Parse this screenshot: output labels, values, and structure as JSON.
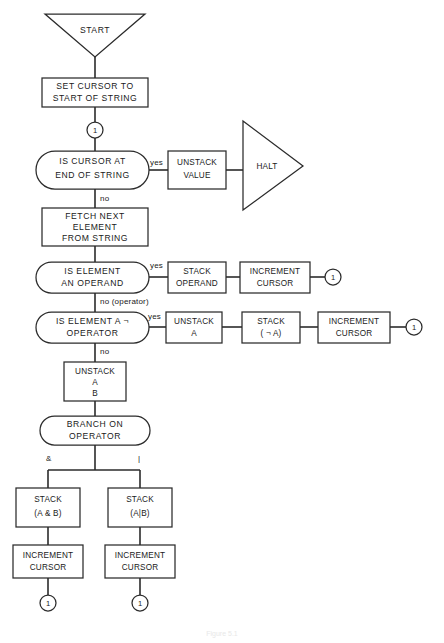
{
  "diagram": {
    "caption": "Figure 5.1",
    "background_color": "#ffffff",
    "line_color": "#2b2b2b",
    "text_color": "#1a1a1a"
  },
  "nodes": {
    "start": {
      "id": "start",
      "shape": "triangle-down",
      "label": "START"
    },
    "set_cursor": {
      "id": "set_cursor",
      "shape": "rect",
      "line1": "SET CURSOR TO",
      "line2": "START OF STRING"
    },
    "conn_top": {
      "id": "conn_top",
      "shape": "circle",
      "label": "1"
    },
    "is_cursor_end": {
      "id": "is_cursor_end",
      "shape": "stadium",
      "line1": "IS CURSOR AT",
      "line2": "END OF STRING"
    },
    "unstack_value": {
      "id": "unstack_value",
      "shape": "rect",
      "line1": "UNSTACK",
      "line2": "VALUE"
    },
    "halt": {
      "id": "halt",
      "shape": "triangle-right",
      "label": "HALT"
    },
    "fetch_next": {
      "id": "fetch_next",
      "shape": "rect",
      "line1": "FETCH NEXT",
      "line2": "ELEMENT",
      "line3": "FROM STRING"
    },
    "is_operand": {
      "id": "is_operand",
      "shape": "stadium",
      "line1": "IS ELEMENT",
      "line2": "AN OPERAND"
    },
    "stack_operand": {
      "id": "stack_operand",
      "shape": "rect",
      "line1": "STACK",
      "line2": "OPERAND"
    },
    "incr_cursor_1": {
      "id": "incr_cursor_1",
      "shape": "rect",
      "line1": "INCREMENT",
      "line2": "CURSOR"
    },
    "conn_r1": {
      "id": "conn_r1",
      "shape": "circle",
      "label": "1"
    },
    "is_not_operator": {
      "id": "is_not_operator",
      "shape": "stadium",
      "line1": "IS ELEMENT A ¬",
      "line2": "OPERATOR"
    },
    "unstack_a": {
      "id": "unstack_a",
      "shape": "rect",
      "line1": "UNSTACK",
      "line2": "A"
    },
    "stack_not_a": {
      "id": "stack_not_a",
      "shape": "rect",
      "line1": "STACK",
      "line2": "( ¬ A)"
    },
    "incr_cursor_2": {
      "id": "incr_cursor_2",
      "shape": "rect",
      "line1": "INCREMENT",
      "line2": "CURSOR"
    },
    "conn_r2": {
      "id": "conn_r2",
      "shape": "circle",
      "label": "1"
    },
    "unstack_ab": {
      "id": "unstack_ab",
      "shape": "rect",
      "line1": "UNSTACK",
      "line2": "A",
      "line3": "B"
    },
    "branch_on_operator": {
      "id": "branch_on_operator",
      "shape": "stadium",
      "line1": "BRANCH ON",
      "line2": "OPERATOR"
    },
    "stack_and": {
      "id": "stack_and",
      "shape": "rect",
      "line1": "STACK",
      "line2": "(A & B)"
    },
    "stack_or": {
      "id": "stack_or",
      "shape": "rect",
      "line1": "STACK",
      "line2": "(A|B)"
    },
    "incr_cursor_3": {
      "id": "incr_cursor_3",
      "shape": "rect",
      "line1": "INCREMENT",
      "line2": "CURSOR"
    },
    "incr_cursor_4": {
      "id": "incr_cursor_4",
      "shape": "rect",
      "line1": "INCREMENT",
      "line2": "CURSOR"
    },
    "conn_b1": {
      "id": "conn_b1",
      "shape": "circle",
      "label": "1"
    },
    "conn_b2": {
      "id": "conn_b2",
      "shape": "circle",
      "label": "1"
    }
  },
  "edge_labels": {
    "yes_1": "yes",
    "no_1": "no",
    "yes_2": "yes",
    "no_operator": "no (operator)",
    "yes_3": "yes",
    "no_2": "no",
    "branch_and": "&",
    "branch_or": "|"
  }
}
